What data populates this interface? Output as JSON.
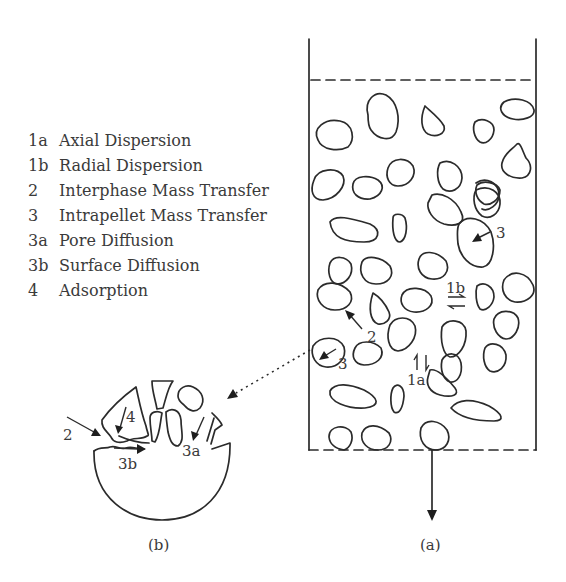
{
  "legend": {
    "items": [
      {
        "code": "1a",
        "label": "Axial Dispersion"
      },
      {
        "code": "1b",
        "label": "Radial Dispersion"
      },
      {
        "code": "2",
        "label": "Interphase Mass Transfer"
      },
      {
        "code": "3",
        "label": "Intrapellet Mass Transfer"
      },
      {
        "code": "3a",
        "label": "Pore Diffusion"
      },
      {
        "code": "3b",
        "label": "Surface Diffusion"
      },
      {
        "code": "4",
        "label": "Adsorption"
      }
    ]
  },
  "column": {
    "caption": "(a)",
    "labels": {
      "pellet_3_upper": "3",
      "pellet_3_lower": "3",
      "interphase": "2",
      "radial": "1b",
      "axial": "1a"
    }
  },
  "pellet": {
    "caption": "(b)",
    "labels": {
      "interphase": "2",
      "adsorption": "4",
      "surface_diffusion": "3b",
      "pore_diffusion": "3a"
    }
  },
  "colors": {
    "ink": "#2b2b2b",
    "text": "#3a3a3a",
    "background": "#ffffff"
  }
}
